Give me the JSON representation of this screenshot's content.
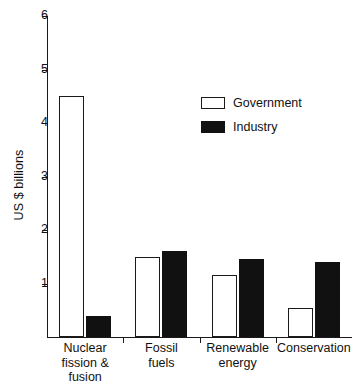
{
  "chart_data": {
    "type": "bar",
    "title": "",
    "xlabel": "",
    "ylabel": "US $ billions",
    "ylim": [
      0,
      6
    ],
    "yticks": [
      1,
      2,
      3,
      4,
      5,
      6
    ],
    "ytick_labels": [
      "1",
      "2",
      "3",
      "4",
      "5",
      "6"
    ],
    "grid": false,
    "legend_position": "upper-right",
    "categories": [
      "Nuclear fission & fusion",
      "Fossil fuels",
      "Renewable energy",
      "Conservation"
    ],
    "category_lines": [
      [
        "Nuclear",
        "fission &",
        "fusion"
      ],
      [
        "Fossil",
        "fuels"
      ],
      [
        "Renewable",
        "energy"
      ],
      [
        "Conservation"
      ]
    ],
    "series": [
      {
        "name": "Government",
        "color": "#ffffff",
        "edge_color": "#1a1a1a",
        "values": [
          4.5,
          1.5,
          1.15,
          0.55
        ]
      },
      {
        "name": "Industry",
        "color": "#111111",
        "edge_color": "#111111",
        "values": [
          0.4,
          1.6,
          1.45,
          1.4
        ]
      }
    ]
  },
  "legend": {
    "items": [
      {
        "label": "Government",
        "style": "government"
      },
      {
        "label": "Industry",
        "style": "industry"
      }
    ]
  },
  "axis": {
    "y_title": "US $ billions"
  }
}
